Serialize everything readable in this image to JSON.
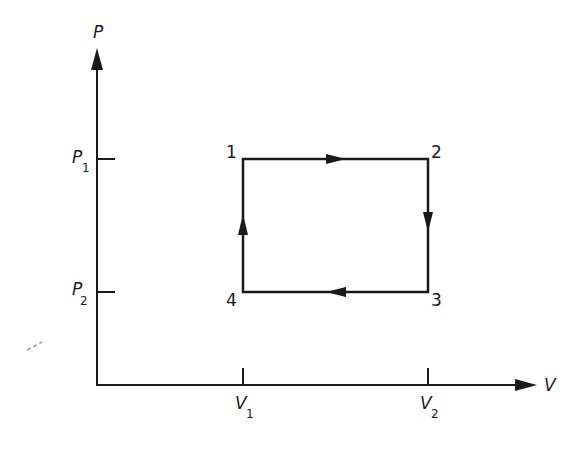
{
  "diagram": {
    "type": "pv-cycle",
    "axes": {
      "y_label": "P",
      "x_label": "V",
      "y_ticks": [
        {
          "base": "P",
          "sub": "1"
        },
        {
          "base": "P",
          "sub": "2"
        }
      ],
      "x_ticks": [
        {
          "base": "V",
          "sub": "1"
        },
        {
          "base": "V",
          "sub": "2"
        }
      ]
    },
    "states": [
      {
        "label": "1",
        "P": "P1",
        "V": "V1"
      },
      {
        "label": "2",
        "P": "P1",
        "V": "V2"
      },
      {
        "label": "3",
        "P": "P2",
        "V": "V2"
      },
      {
        "label": "4",
        "P": "P2",
        "V": "V1"
      }
    ],
    "processes": [
      {
        "from": "1",
        "to": "2",
        "direction": "right"
      },
      {
        "from": "2",
        "to": "3",
        "direction": "down"
      },
      {
        "from": "3",
        "to": "4",
        "direction": "left"
      },
      {
        "from": "4",
        "to": "1",
        "direction": "up"
      }
    ],
    "line_color": "#1a1a1a"
  }
}
